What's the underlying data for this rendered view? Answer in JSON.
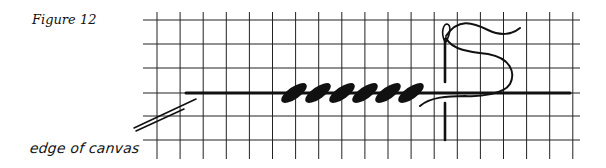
{
  "figure": {
    "title": "Figure 12",
    "edge_label": "edge of canvas"
  },
  "grid": {
    "x_start": 157,
    "x_spacing": 23.1,
    "columns": 19,
    "y_lines": [
      20,
      44,
      68,
      93,
      116,
      140
    ],
    "v_top": 12,
    "v_bottom": 159,
    "h_left": 143,
    "h_right": 580,
    "color": "#222222"
  },
  "thread": {
    "y": 93,
    "x_from": 186,
    "x_to": 570,
    "color": "#111111"
  },
  "stitches": {
    "count": 6,
    "centers_x": [
      294,
      318,
      342,
      365,
      388,
      411
    ],
    "center_y": 93,
    "rx": 15,
    "ry": 6,
    "angle": -35,
    "color": "#111111"
  },
  "needle": {
    "x": 445,
    "top_y": 25,
    "gap_from": 82,
    "gap_to": 103,
    "bottom_y": 140
  },
  "canvas_edge": {
    "line1": [
      134,
      128,
      196,
      99
    ],
    "line2": [
      136,
      131,
      184,
      109
    ]
  }
}
